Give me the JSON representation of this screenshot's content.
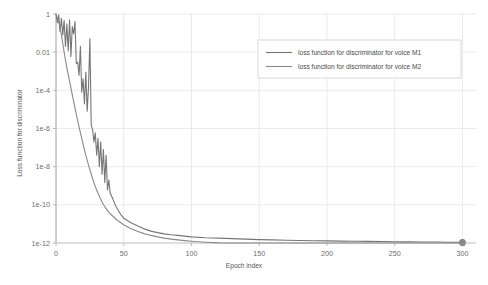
{
  "chart_data": {
    "type": "line",
    "title": "",
    "xlabel": "Epoch index",
    "ylabel": "Loss function for discriminator",
    "yscale": "log",
    "xlim": [
      0,
      310
    ],
    "ylim": [
      1e-12,
      1
    ],
    "grid": true,
    "legend_position": "top-right",
    "xticks": [
      "0",
      "50",
      "100",
      "150",
      "200",
      "250",
      "300"
    ],
    "xtick_values": [
      0,
      50,
      100,
      150,
      200,
      250,
      300
    ],
    "yticks": [
      "1",
      "0.01",
      "1e-4",
      "1e-6",
      "1e-8",
      "1e-10",
      "1e-12"
    ],
    "ytick_values": [
      1,
      0.01,
      0.0001,
      1e-06,
      1e-08,
      1e-10,
      1e-12
    ],
    "series": [
      {
        "name": "loss function for discriminator for voice M1",
        "color": "#767676",
        "marker_end": true,
        "x": [
          0,
          1,
          2,
          3,
          4,
          5,
          6,
          7,
          8,
          9,
          10,
          11,
          12,
          13,
          14,
          15,
          16,
          17,
          18,
          19,
          20,
          21,
          22,
          23,
          24,
          25,
          26,
          27,
          28,
          29,
          30,
          31,
          32,
          33,
          34,
          35,
          36,
          37,
          38,
          39,
          40,
          42,
          44,
          46,
          48,
          50,
          55,
          60,
          65,
          70,
          75,
          80,
          85,
          90,
          95,
          100,
          110,
          120,
          130,
          140,
          150,
          160,
          170,
          180,
          190,
          200,
          210,
          220,
          230,
          240,
          250,
          260,
          270,
          280,
          290,
          300
        ],
        "y": [
          1.0,
          0.35,
          0.9,
          0.12,
          0.6,
          0.08,
          0.45,
          0.02,
          0.3,
          0.012,
          0.5,
          0.006,
          0.22,
          0.09,
          0.4,
          0.0025,
          0.003,
          0.0006,
          0.02,
          8e-05,
          0.0004,
          2e-05,
          0.0009,
          8e-06,
          0.00015,
          0.05,
          1.5e-06,
          9e-07,
          2e-07,
          6e-07,
          4e-08,
          3e-07,
          1e-08,
          2e-07,
          4e-09,
          8e-08,
          1.5e-09,
          4e-08,
          6e-10,
          2e-09,
          4e-10,
          2e-10,
          9e-11,
          5e-11,
          3e-11,
          2e-11,
          1.2e-11,
          8e-12,
          5.5e-12,
          4.2e-12,
          3.5e-12,
          3e-12,
          2.7e-12,
          2.5e-12,
          2.3e-12,
          2.1e-12,
          1.9e-12,
          1.8e-12,
          1.7e-12,
          1.6e-12,
          1.5e-12,
          1.45e-12,
          1.4e-12,
          1.36e-12,
          1.32e-12,
          1.29e-12,
          1.26e-12,
          1.23e-12,
          1.21e-12,
          1.19e-12,
          1.17e-12,
          1.15e-12,
          1.13e-12,
          1.12e-12,
          1.1e-12,
          1.09e-12
        ]
      },
      {
        "name": "loss function for discriminator for voice M2",
        "color": "#8a8a8a",
        "marker_end": true,
        "x": [
          0,
          2,
          4,
          6,
          8,
          10,
          12,
          14,
          16,
          18,
          20,
          22,
          24,
          26,
          28,
          30,
          32,
          34,
          36,
          38,
          40,
          45,
          50,
          55,
          60,
          65,
          70,
          75,
          80,
          85,
          90,
          95,
          100,
          110,
          120,
          130,
          140,
          150,
          160,
          170,
          180,
          190,
          200,
          210,
          220,
          230,
          240,
          250,
          260,
          270,
          280,
          290,
          300
        ],
        "y": [
          1.0,
          0.4,
          0.08,
          0.01,
          0.0015,
          0.0003,
          6e-05,
          1.2e-05,
          2.5e-06,
          6e-07,
          1.5e-07,
          4e-08,
          1.2e-08,
          4e-09,
          1.4e-09,
          6e-10,
          2.8e-10,
          1.4e-10,
          8e-11,
          5e-11,
          3.4e-11,
          1.6e-11,
          9e-12,
          5.8e-12,
          4.1e-12,
          3.1e-12,
          2.5e-12,
          2.1e-12,
          1.8e-12,
          1.6e-12,
          1.45e-12,
          1.33e-12,
          1.24e-12,
          1.1e-12,
          1.01e-12,
          9.5e-13,
          9e-13,
          8.6e-13,
          8.3e-13,
          8e-13,
          7.8e-13,
          7.6e-13,
          7.4e-13,
          7.3e-13,
          7.2e-13,
          7.1e-13,
          7.05e-13,
          7e-13,
          6.95e-13,
          6.9e-13,
          6.87e-13,
          6.84e-13,
          6.81e-13
        ]
      }
    ]
  },
  "legend": {
    "items": [
      {
        "label": "loss function for discriminator for voice M1"
      },
      {
        "label": "loss function for discriminator for voice M2"
      }
    ]
  },
  "axes": {
    "x_title": "Epoch index",
    "y_title": "Loss function for discriminator"
  },
  "colors": {
    "background": "#ffffff",
    "grid": "#e8e8e8",
    "axis": "#b5b5b5",
    "series_1": "#767676",
    "series_2": "#8a8a8a",
    "tick_text": "#6d6d6d"
  }
}
